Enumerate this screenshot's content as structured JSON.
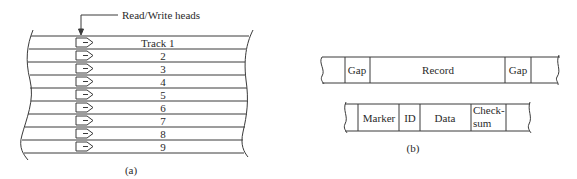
{
  "figure_a": {
    "caption": "(a)",
    "pointer_label": "Read/Write heads",
    "tracks": [
      {
        "label": "Track 1"
      },
      {
        "label": "2"
      },
      {
        "label": "3"
      },
      {
        "label": "4"
      },
      {
        "label": "5"
      },
      {
        "label": "6"
      },
      {
        "label": "7"
      },
      {
        "label": "8"
      },
      {
        "label": "9"
      }
    ],
    "head_icon": "read-write-head-icon"
  },
  "figure_b": {
    "caption": "(b)",
    "tape_layout": [
      {
        "label": "Gap"
      },
      {
        "label": "Record"
      },
      {
        "label": "Gap"
      }
    ],
    "record_layout": [
      {
        "label": "Marker"
      },
      {
        "label": "ID"
      },
      {
        "label": "Data"
      },
      {
        "label": "Check-"
      },
      {
        "label": "sum"
      }
    ]
  },
  "colors": {
    "line": "#3a3a3a",
    "background": "#ffffff"
  }
}
